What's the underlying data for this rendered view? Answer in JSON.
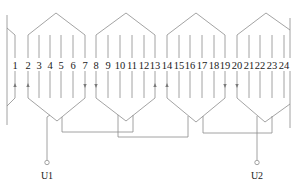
{
  "diagram": {
    "type": "stator winding expansion diagram",
    "slot_count": 24,
    "slots": [
      {
        "n": "1",
        "x": 15
      },
      {
        "n": "2",
        "x": 28
      },
      {
        "n": "3",
        "x": 39
      },
      {
        "n": "4",
        "x": 50
      },
      {
        "n": "5",
        "x": 61
      },
      {
        "n": "6",
        "x": 73
      },
      {
        "n": "7",
        "x": 85
      },
      {
        "n": "8",
        "x": 96
      },
      {
        "n": "9",
        "x": 108
      },
      {
        "n": "10",
        "x": 120
      },
      {
        "n": "11",
        "x": 132
      },
      {
        "n": "12",
        "x": 144
      },
      {
        "n": "13",
        "x": 155
      },
      {
        "n": "14",
        "x": 167
      },
      {
        "n": "15",
        "x": 179
      },
      {
        "n": "16",
        "x": 190
      },
      {
        "n": "17",
        "x": 202
      },
      {
        "n": "18",
        "x": 214
      },
      {
        "n": "19",
        "x": 225
      },
      {
        "n": "20",
        "x": 237
      },
      {
        "n": "21",
        "x": 249
      },
      {
        "n": "22",
        "x": 260
      },
      {
        "n": "23",
        "x": 272
      },
      {
        "n": "24",
        "x": 284
      }
    ],
    "coil_groups": [
      {
        "name": "coil-group-1",
        "slots": [
          "2",
          "7"
        ]
      },
      {
        "name": "coil-group-2",
        "slots": [
          "8",
          "13"
        ]
      },
      {
        "name": "coil-group-3",
        "slots": [
          "14",
          "19"
        ]
      },
      {
        "name": "coil-group-4",
        "slots": [
          "20",
          "1"
        ]
      }
    ],
    "current_arrows": [
      {
        "slot": "1",
        "direction": "up"
      },
      {
        "slot": "2",
        "direction": "up"
      },
      {
        "slot": "7",
        "direction": "down"
      },
      {
        "slot": "8",
        "direction": "down"
      },
      {
        "slot": "13",
        "direction": "up"
      },
      {
        "slot": "14",
        "direction": "up"
      },
      {
        "slot": "19",
        "direction": "down"
      },
      {
        "slot": "20",
        "direction": "down"
      }
    ],
    "terminals": {
      "start": {
        "label": "U1"
      },
      "end": {
        "label": "U2"
      }
    },
    "colors": {
      "wire": "#8c8c8c",
      "text": "#1a1a1a"
    }
  }
}
